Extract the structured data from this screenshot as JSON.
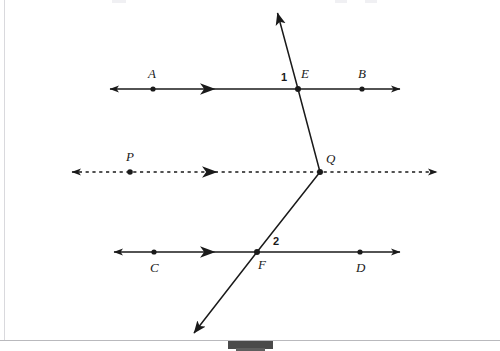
{
  "figure": {
    "canvas": {
      "width": 500,
      "height": 351
    },
    "stroke_color": "#1a1a1a",
    "dot_color": "#1a1a1a",
    "border_color": "#d9d9dd",
    "stand_color": "#4a4a4a",
    "labels": {
      "A": "A",
      "B": "B",
      "C": "C",
      "D": "D",
      "E": "E",
      "F": "F",
      "P": "P",
      "Q": "Q",
      "angle1": "1",
      "angle2": "2"
    },
    "lines": [
      {
        "name": "line-AB",
        "style": "solid",
        "y": 89,
        "x_start": 110,
        "x_end": 400,
        "points": [
          {
            "label": "A",
            "x": 153
          },
          {
            "label": "E",
            "x": 298
          },
          {
            "label": "B",
            "x": 362
          }
        ],
        "direction_mark_x": 210
      },
      {
        "name": "line-PQ",
        "style": "dashed",
        "y": 172,
        "x_start": 72,
        "x_end": 437,
        "points": [
          {
            "label": "P",
            "x": 130
          },
          {
            "label": "Q",
            "x": 320
          }
        ],
        "direction_mark_x": 212
      },
      {
        "name": "line-CD",
        "style": "solid",
        "y": 252,
        "x_start": 114,
        "x_end": 400,
        "points": [
          {
            "label": "C",
            "x": 154
          },
          {
            "label": "F",
            "x": 257
          },
          {
            "label": "D",
            "x": 360
          }
        ],
        "direction_mark_x": 210
      }
    ],
    "transversal": {
      "name": "transversal-ray",
      "type": "bent-double-arrow",
      "vertices": [
        {
          "x": 277,
          "y": 12
        },
        {
          "x": 298,
          "y": 89
        },
        {
          "x": 320,
          "y": 172
        },
        {
          "x": 257,
          "y": 252
        },
        {
          "x": 193,
          "y": 334
        }
      ],
      "arrow_at_start": true,
      "arrow_at_end": true
    },
    "label_positions": [
      {
        "key": "A",
        "x": 148,
        "y": 67,
        "kind": "point"
      },
      {
        "key": "B",
        "x": 358,
        "y": 67,
        "kind": "point"
      },
      {
        "key": "E",
        "x": 301,
        "y": 67,
        "kind": "point"
      },
      {
        "key": "angle1",
        "x": 281,
        "y": 72,
        "kind": "angle"
      },
      {
        "key": "P",
        "x": 126,
        "y": 150,
        "kind": "point"
      },
      {
        "key": "Q",
        "x": 326,
        "y": 152,
        "kind": "point"
      },
      {
        "key": "C",
        "x": 150,
        "y": 261,
        "kind": "point"
      },
      {
        "key": "D",
        "x": 356,
        "y": 261,
        "kind": "point"
      },
      {
        "key": "F",
        "x": 258,
        "y": 258,
        "kind": "point"
      },
      {
        "key": "angle2",
        "x": 273,
        "y": 236,
        "kind": "angle"
      }
    ]
  }
}
